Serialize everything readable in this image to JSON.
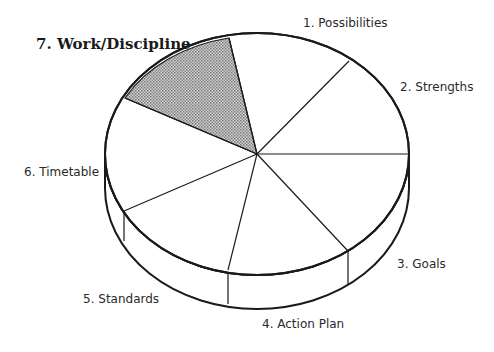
{
  "diagram": {
    "type": "3d-pie",
    "segments": [
      {
        "id": 1,
        "label": "1. Possibilities",
        "highlighted": false
      },
      {
        "id": 2,
        "label": "2. Strengths",
        "highlighted": false
      },
      {
        "id": 3,
        "label": "3. Goals",
        "highlighted": false
      },
      {
        "id": 4,
        "label": "4. Action Plan",
        "highlighted": false
      },
      {
        "id": 5,
        "label": "5. Standards",
        "highlighted": false
      },
      {
        "id": 6,
        "label": "6. Timetable",
        "highlighted": false
      },
      {
        "id": 7,
        "label": "7. Work/Discipline",
        "highlighted": true
      }
    ],
    "colors": {
      "stroke": "#1a1a1a",
      "fill": "#ffffff",
      "highlight_fill": "#a8a8a8"
    }
  }
}
